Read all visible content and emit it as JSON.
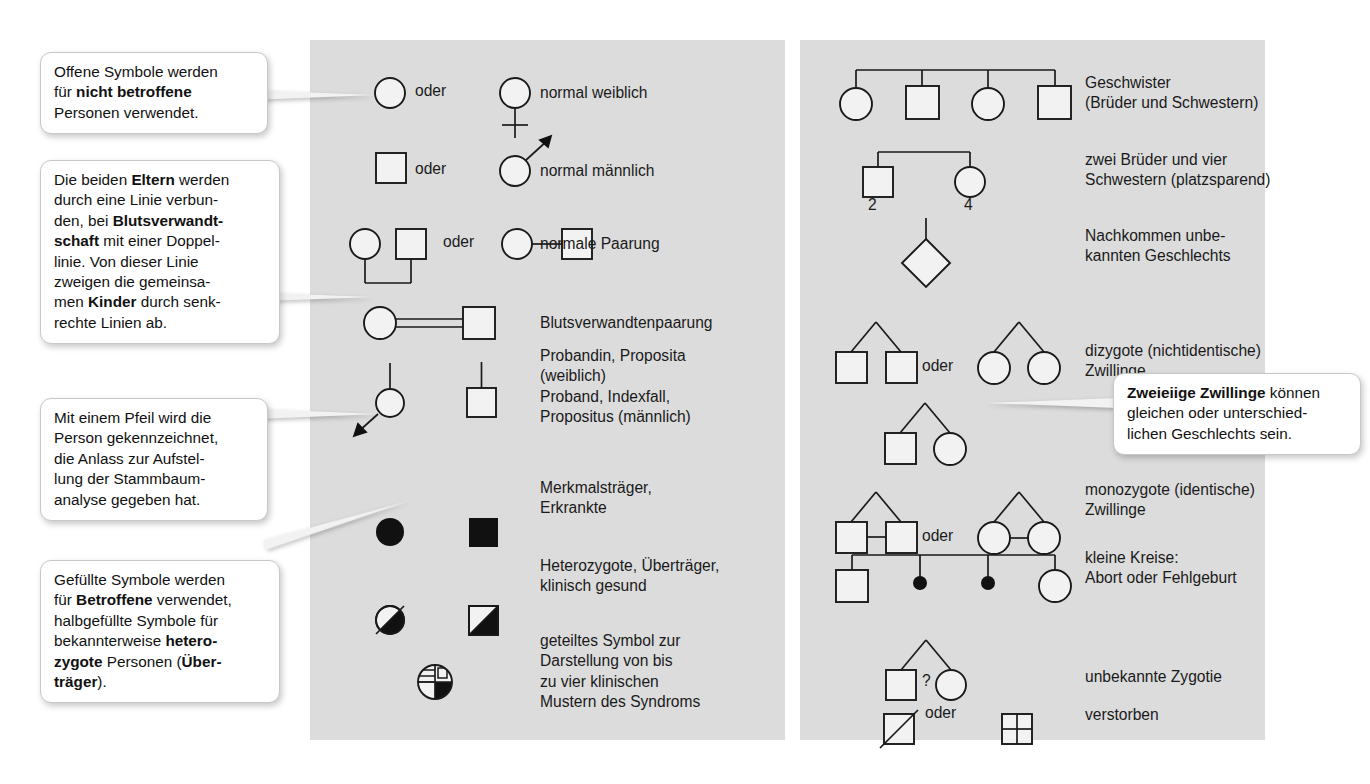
{
  "figure": {
    "type": "pedigree-symbol-legend",
    "language": "de",
    "panel_bg": "#dcdcdc",
    "ink": "#1a1a1a"
  },
  "callouts": [
    {
      "id": "open-symbols",
      "runs": [
        {
          "t": "Offene Symbole werden\nfür ",
          "b": false
        },
        {
          "t": "nicht betroffene",
          "b": true
        },
        {
          "t": "\nPersonen verwendet.",
          "b": false
        }
      ],
      "plain": "Offene Symbole werden für nicht betroffene Personen verwendet."
    },
    {
      "id": "parents-line",
      "runs": [
        {
          "t": "Die beiden ",
          "b": false
        },
        {
          "t": "Eltern",
          "b": true
        },
        {
          "t": " werden\ndurch eine Linie verbun-\nden, bei ",
          "b": false
        },
        {
          "t": "Blutsverwandt-\nschaft",
          "b": true
        },
        {
          "t": " mit einer Doppel-\nlinie. Von dieser Linie\nzweigen die gemeinsa-\nmen ",
          "b": false
        },
        {
          "t": "Kinder",
          "b": true
        },
        {
          "t": " durch senk-\nrechte Linien ab.",
          "b": false
        }
      ],
      "plain": "Die beiden Eltern werden durch eine Linie verbunden, bei Blutsverwandtschaft mit einer Doppellinie. Von dieser Linie zweigen die gemeinsamen Kinder durch senkrechte Linien ab."
    },
    {
      "id": "proband-arrow",
      "runs": [
        {
          "t": "Mit einem Pfeil wird die\nPerson gekennzeichnet,\ndie Anlass zur Aufstel-\nlung der Stammbaum-\nanalyse gegeben hat.",
          "b": false
        }
      ],
      "plain": "Mit einem Pfeil wird die Person gekennzeichnet, die Anlass zur Aufstellung der Stammbaumanalyse gegeben hat."
    },
    {
      "id": "filled-symbols",
      "runs": [
        {
          "t": "Gefüllte Symbole werden\nfür ",
          "b": false
        },
        {
          "t": "Betroffene",
          "b": true
        },
        {
          "t": " verwendet,\nhalbgefüllte Symbole für\nbekannterweise ",
          "b": false
        },
        {
          "t": "hetero-\nzygote",
          "b": true
        },
        {
          "t": " Personen (",
          "b": false
        },
        {
          "t": "Über-\nträger",
          "b": true
        },
        {
          "t": ").",
          "b": false
        }
      ],
      "plain": "Gefüllte Symbole werden für Betroffene verwendet, halbgefüllte Symbole für bekannterweise heterozygote Personen (Überträger)."
    },
    {
      "id": "dizygotic-twins",
      "runs": [
        {
          "t": "Zweieiige Zwillinge",
          "b": true
        },
        {
          "t": " können\ngleichen oder unterschied-\nlichen Geschlechts sein.",
          "b": false
        }
      ],
      "plain": "Zweieiige Zwillinge können gleichen oder unterschiedlichen Geschlechts sein."
    }
  ],
  "left_panel": {
    "oder_word": "oder",
    "rows": [
      {
        "id": "normal-female",
        "label": "normal weiblich",
        "symbols": [
          "open-circle",
          "venus-circle"
        ],
        "has_oder": true
      },
      {
        "id": "normal-male",
        "label": "normal männlich",
        "symbols": [
          "open-square",
          "mars-circle"
        ],
        "has_oder": true
      },
      {
        "id": "normal-mating",
        "label": "normale Paarung",
        "symbols": [
          "circle-square-dropline",
          "circle-line-square"
        ],
        "has_oder": true
      },
      {
        "id": "consanguineous-mating",
        "label": "Blutsverwandtenpaarung",
        "symbols": [
          "circle-doubleline-square"
        ],
        "has_oder": false
      },
      {
        "id": "proband",
        "label": "Probandin, Proposita\n(weiblich)\nProband, Indexfall,\nPropositus (männlich)",
        "symbols": [
          "proband-circle-arrow",
          "proband-square"
        ],
        "has_oder": false
      },
      {
        "id": "affected",
        "label": "Merkmalsträger,\nErkrankte",
        "symbols": [
          "filled-circle",
          "filled-square"
        ],
        "has_oder": false
      },
      {
        "id": "heterozygote",
        "label": "Heterozygote, Überträger,\nklinisch gesund",
        "symbols": [
          "half-filled-circle",
          "half-filled-square"
        ],
        "has_oder": false
      },
      {
        "id": "quartered",
        "label": "geteiltes Symbol zur\nDarstellung von bis\nzu vier klinischen\nMustern des Syndroms",
        "symbols": [
          "quartered-circle"
        ],
        "has_oder": false
      }
    ]
  },
  "right_panel": {
    "oder_word": "oder",
    "question_mark": "?",
    "sibship_counts": {
      "brothers": "2",
      "sisters": "4"
    },
    "rows": [
      {
        "id": "siblings",
        "label": "Geschwister\n(Brüder und Schwestern)",
        "symbols": [
          "sibship-circle-square-circle-square"
        ],
        "has_oder": false
      },
      {
        "id": "sibship-condensed",
        "label": "zwei Brüder und vier\nSchwestern (platzsparend)",
        "symbols": [
          "numbered-square-2",
          "numbered-circle-4"
        ],
        "has_oder": false
      },
      {
        "id": "unknown-sex",
        "label": "Nachkommen unbe-\nkannten Geschlechts",
        "symbols": [
          "diamond-with-stem"
        ],
        "has_oder": false
      },
      {
        "id": "dizygotic",
        "label": "dizygote (nichtidentische)\nZwillinge",
        "symbols": [
          "twin-v-square-square",
          "twin-v-circle-circle"
        ],
        "has_oder": true
      },
      {
        "id": "dizygotic-mixed",
        "label": "",
        "symbols": [
          "twin-v-square-circle"
        ],
        "has_oder": false
      },
      {
        "id": "monozygotic",
        "label": "monozygote (identische)\nZwillinge",
        "symbols": [
          "twin-bar-square-square",
          "twin-bar-circle-circle"
        ],
        "has_oder": true
      },
      {
        "id": "abortion",
        "label": "kleine Kreise:\nAbort oder Fehlgeburt",
        "symbols": [
          "sibship-square-dot-dot-circle"
        ],
        "has_oder": false
      },
      {
        "id": "unknown-zygosity",
        "label": "unbekannte Zygotie",
        "symbols": [
          "twin-v-square-qmark-circle"
        ],
        "has_oder": false
      },
      {
        "id": "deceased",
        "label": "verstorben",
        "symbols": [
          "slashed-square",
          "crossed-square"
        ],
        "has_oder": true
      }
    ]
  }
}
